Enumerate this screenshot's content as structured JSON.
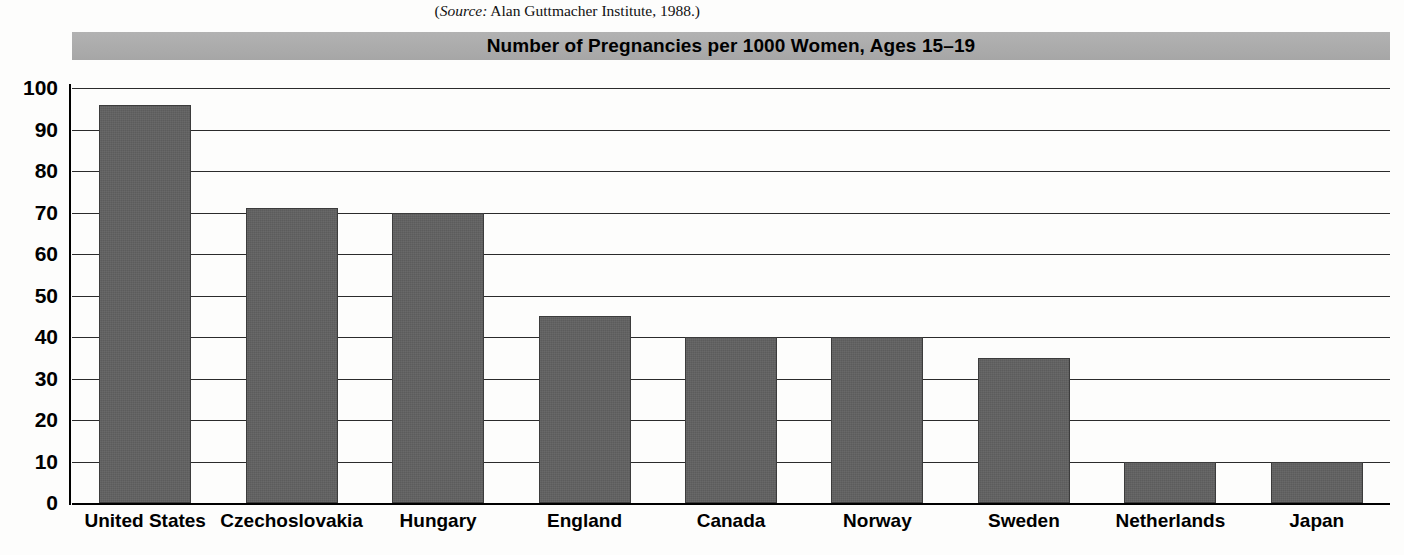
{
  "source": {
    "prefix": "(",
    "label": "Source:",
    "text": " Alan Guttmacher Institute, 1988.)"
  },
  "chart_data": {
    "type": "bar",
    "title": "Number of Pregnancies per 1000 Women, Ages 15–19",
    "xlabel": "",
    "ylabel": "",
    "categories": [
      "United States",
      "Czechoslovakia",
      "Hungary",
      "England",
      "Canada",
      "Norway",
      "Sweden",
      "Netherlands",
      "Japan"
    ],
    "values": [
      96,
      71,
      70,
      45,
      40,
      40,
      35,
      10,
      10
    ],
    "ylim": [
      0,
      100
    ],
    "ytick_labels": [
      "100",
      "90",
      "80",
      "70",
      "60",
      "50",
      "40",
      "30",
      "20",
      "10",
      "0"
    ],
    "ytick_values": [
      100,
      90,
      80,
      70,
      60,
      50,
      40,
      30,
      20,
      10,
      0
    ],
    "grid": true,
    "legend": "none",
    "colors": {
      "bar_fill": "#5c5c5c",
      "bar_border": "#3c3c3c",
      "title_bar": "#ababab",
      "gridline": "#2b2b2b",
      "axis": "#000000",
      "background": "#fdfdfc"
    }
  }
}
